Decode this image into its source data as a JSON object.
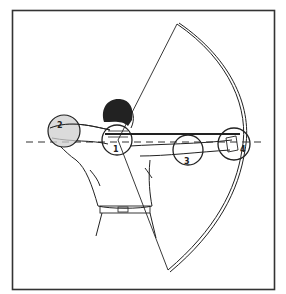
{
  "figure": {
    "frame": {
      "x": 12,
      "y": 10,
      "width": 262,
      "height": 279,
      "stroke": "#333333"
    },
    "alignment_line": {
      "style": "dashed",
      "y": 142
    },
    "checkpoints": [
      {
        "number": "1",
        "location": "draw hand at face (anchor)",
        "cx": 117,
        "cy": 140,
        "r": 15
      },
      {
        "number": "2",
        "location": "draw-arm elbow",
        "cx": 64,
        "cy": 131,
        "r": 16,
        "shaded": true
      },
      {
        "number": "3",
        "location": "bow-arm forearm",
        "cx": 188,
        "cy": 150,
        "r": 15
      },
      {
        "number": "4",
        "location": "bow hand grip",
        "cx": 234,
        "cy": 144,
        "r": 16
      }
    ],
    "colors": {
      "line": "#222222",
      "shade": "#cfcfcf",
      "background": "#ffffff"
    }
  }
}
